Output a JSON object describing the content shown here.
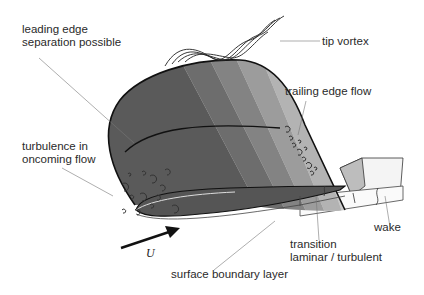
{
  "figure": {
    "labels": {
      "leading_edge_line1": "leading edge",
      "leading_edge_line2": "separation possible",
      "tip_vortex": "tip vortex",
      "trailing_edge_flow": "trailing edge flow",
      "turbulence_line1": "turbulence in",
      "turbulence_line2": "oncoming flow",
      "velocity_symbol": "U",
      "wake": "wake",
      "transition_line1": "transition",
      "transition_line2": "laminar / turbulent",
      "surface_boundary_layer": "surface boundary layer"
    },
    "colors": {
      "background": "#ffffff",
      "outline": "#111111",
      "leader_line": "#777777",
      "wing_dark": "#5a5a5a",
      "wing_mid": "#8a8a8a",
      "wing_light": "#c4c4c4",
      "wake_fill": "#f2f2f2"
    }
  }
}
